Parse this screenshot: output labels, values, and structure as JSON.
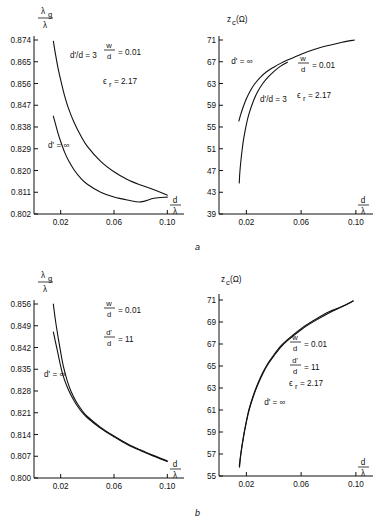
{
  "figure": {
    "caption_a": "a",
    "caption_b": "b"
  },
  "chart_data": [
    {
      "id": "panel-a-left",
      "type": "line",
      "title": "",
      "ylabel": "λ_g/λ",
      "xlabel": "d/λ",
      "ylabel_num": "λ",
      "ylabel_num_sub": "g",
      "ylabel_den": "λ",
      "xlabel_num": "d",
      "xlabel_den": "λ",
      "xlim": [
        0.0,
        0.11
      ],
      "ylim": [
        0.802,
        0.874
      ],
      "xticks": [
        0.02,
        0.06,
        0.1
      ],
      "xtick_labels": [
        "0.02",
        "0.06",
        "0.10"
      ],
      "yticks": [
        0.802,
        0.811,
        0.82,
        0.829,
        0.838,
        0.847,
        0.856,
        0.865,
        0.874
      ],
      "ytick_labels": [
        "0.802",
        "0.811",
        "0.820",
        "0.829",
        "0.838",
        "0.847",
        "0.856",
        "0.865",
        "0.874"
      ],
      "grid": false,
      "annotations": [
        {
          "text": "d'/d = 3",
          "x": 0.027,
          "y": 0.8665
        },
        {
          "text": "d' = ∞",
          "x": 0.0105,
          "y": 0.8295
        }
      ],
      "param_w_over_d": "0.01",
      "param_eps_r": "2.17",
      "param_labels": {
        "w_num": "w",
        "w_den": "d",
        "w_val": "= 0.01",
        "eps": "ϵ",
        "eps_sub": "r",
        "eps_val": "= 2.17"
      },
      "series": [
        {
          "name": "d'/d = 3",
          "points": [
            [
              0.0145,
              0.8735
            ],
            [
              0.016,
              0.8685
            ],
            [
              0.018,
              0.8625
            ],
            [
              0.02,
              0.8575
            ],
            [
              0.023,
              0.8508
            ],
            [
              0.026,
              0.8455
            ],
            [
              0.03,
              0.84
            ],
            [
              0.035,
              0.8345
            ],
            [
              0.04,
              0.83
            ],
            [
              0.05,
              0.8238
            ],
            [
              0.06,
              0.8195
            ],
            [
              0.07,
              0.8163
            ],
            [
              0.08,
              0.814
            ],
            [
              0.09,
              0.812
            ],
            [
              0.1,
              0.8098
            ]
          ]
        },
        {
          "name": "d' = ∞",
          "points": [
            [
              0.0145,
              0.8425
            ],
            [
              0.016,
              0.8395
            ],
            [
              0.018,
              0.8355
            ],
            [
              0.02,
              0.832
            ],
            [
              0.023,
              0.8275
            ],
            [
              0.026,
              0.824
            ],
            [
              0.03,
              0.8203
            ],
            [
              0.035,
              0.8168
            ],
            [
              0.04,
              0.8143
            ],
            [
              0.05,
              0.811
            ],
            [
              0.06,
              0.809
            ],
            [
              0.07,
              0.8078
            ],
            [
              0.08,
              0.807
            ],
            [
              0.09,
              0.8085
            ],
            [
              0.1,
              0.809
            ]
          ]
        }
      ]
    },
    {
      "id": "panel-a-right",
      "type": "line",
      "title": "",
      "ylabel": "z_c (Ω)",
      "xlabel": "d/λ",
      "ylabel_main": "z",
      "ylabel_sub": "c",
      "ylabel_unit": "(Ω)",
      "xlabel_num": "d",
      "xlabel_den": "λ",
      "xlim": [
        0.0,
        0.11
      ],
      "ylim": [
        39,
        71
      ],
      "xticks": [
        0.02,
        0.06,
        0.1
      ],
      "xtick_labels": [
        "0.02",
        "0.06",
        "0.10"
      ],
      "yticks": [
        39,
        43,
        47,
        51,
        55,
        59,
        63,
        67,
        71
      ],
      "ytick_labels": [
        "39",
        "43",
        "47",
        "51",
        "55",
        "59",
        "63",
        "67",
        "71"
      ],
      "grid": false,
      "annotations": [
        {
          "text": "d' = ∞",
          "x": 0.009,
          "y": 66.6
        },
        {
          "text": "d'/d = 3",
          "x": 0.03,
          "y": 59.6
        }
      ],
      "param_w_over_d": "0.01",
      "param_eps_r": "2.17",
      "param_labels": {
        "w_num": "w",
        "w_den": "d",
        "w_val": "= 0.01",
        "eps": "ϵ",
        "eps_sub": "r",
        "eps_val": "= 2.17"
      },
      "series": [
        {
          "name": "d' = ∞",
          "points": [
            [
              0.0145,
              56.1
            ],
            [
              0.016,
              57.4
            ],
            [
              0.018,
              58.9
            ],
            [
              0.02,
              60.2
            ],
            [
              0.023,
              61.7
            ],
            [
              0.026,
              62.9
            ],
            [
              0.03,
              64.1
            ],
            [
              0.035,
              65.2
            ],
            [
              0.04,
              66.0
            ],
            [
              0.045,
              66.7
            ],
            [
              0.05,
              67.3
            ],
            [
              0.06,
              68.4
            ],
            [
              0.07,
              69.3
            ],
            [
              0.08,
              70.0
            ],
            [
              0.09,
              70.6
            ],
            [
              0.099,
              71.0
            ]
          ]
        },
        {
          "name": "d'/d = 3",
          "points": [
            [
              0.0148,
              44.7
            ],
            [
              0.0152,
              46.6
            ],
            [
              0.016,
              48.8
            ],
            [
              0.017,
              51.0
            ],
            [
              0.018,
              52.8
            ],
            [
              0.02,
              55.5
            ],
            [
              0.022,
              57.5
            ],
            [
              0.025,
              59.7
            ],
            [
              0.028,
              61.4
            ],
            [
              0.032,
              63.0
            ],
            [
              0.036,
              64.2
            ],
            [
              0.04,
              65.2
            ],
            [
              0.045,
              66.2
            ],
            [
              0.05,
              66.9
            ]
          ]
        }
      ]
    },
    {
      "id": "panel-b-left",
      "type": "line",
      "title": "",
      "ylabel": "λ_g/λ",
      "xlabel": "d/λ",
      "ylabel_num": "λ",
      "ylabel_num_sub": "g",
      "ylabel_den": "λ",
      "xlabel_num": "d",
      "xlabel_den": "λ",
      "xlim": [
        0.0,
        0.11
      ],
      "ylim": [
        0.8,
        0.856
      ],
      "xticks": [
        0.02,
        0.06,
        0.1
      ],
      "xtick_labels": [
        "0.02",
        "0.06",
        "0.10"
      ],
      "yticks": [
        0.8,
        0.807,
        0.814,
        0.821,
        0.828,
        0.835,
        0.842,
        0.849,
        0.856
      ],
      "ytick_labels": [
        "0.800",
        "0.807",
        "0.814",
        "0.821",
        "0.828",
        "0.835",
        "0.842",
        "0.849",
        "0.856"
      ],
      "grid": false,
      "annotations": [
        {
          "text": "d' = ∞",
          "x": 0.0075,
          "y": 0.8325
        }
      ],
      "param_labels": {
        "w_num": "w",
        "w_den": "d",
        "w_val": "= 0.01",
        "dp_num": "d'",
        "dp_den": "d",
        "dp_val": "= 11"
      },
      "series": [
        {
          "name": "d'/d = 11",
          "points": [
            [
              0.0145,
              0.856
            ],
            [
              0.016,
              0.851
            ],
            [
              0.018,
              0.8455
            ],
            [
              0.02,
              0.8405
            ],
            [
              0.022,
              0.836
            ],
            [
              0.025,
              0.8312
            ],
            [
              0.028,
              0.8277
            ],
            [
              0.032,
              0.8243
            ],
            [
              0.036,
              0.8218
            ],
            [
              0.04,
              0.8198
            ],
            [
              0.05,
              0.8163
            ],
            [
              0.06,
              0.8135
            ],
            [
              0.07,
              0.811
            ],
            [
              0.08,
              0.809
            ],
            [
              0.09,
              0.8072
            ],
            [
              0.1,
              0.8055
            ]
          ]
        },
        {
          "name": "d' = ∞",
          "points": [
            [
              0.0145,
              0.847
            ],
            [
              0.016,
              0.844
            ],
            [
              0.018,
              0.84
            ],
            [
              0.02,
              0.836
            ],
            [
              0.022,
              0.8327
            ],
            [
              0.025,
              0.8292
            ],
            [
              0.028,
              0.8265
            ],
            [
              0.032,
              0.8235
            ],
            [
              0.036,
              0.8212
            ],
            [
              0.04,
              0.8194
            ],
            [
              0.05,
              0.816
            ],
            [
              0.06,
              0.8133
            ],
            [
              0.07,
              0.8108
            ],
            [
              0.08,
              0.8088
            ],
            [
              0.09,
              0.807
            ],
            [
              0.1,
              0.8053
            ]
          ]
        }
      ]
    },
    {
      "id": "panel-b-right",
      "type": "line",
      "title": "",
      "ylabel": "z_c (Ω)",
      "xlabel": "d/λ",
      "ylabel_main": "z",
      "ylabel_sub": "c",
      "ylabel_unit": "(Ω)",
      "xlabel_num": "d",
      "xlabel_den": "λ",
      "xlim": [
        0.0,
        0.11
      ],
      "ylim": [
        55,
        71
      ],
      "xticks": [
        0.02,
        0.06,
        0.1
      ],
      "xtick_labels": [
        "0.02",
        "0.06",
        "0.10"
      ],
      "yticks": [
        55,
        57,
        59,
        61,
        63,
        65,
        67,
        69,
        71
      ],
      "ytick_labels": [
        "55",
        "57",
        "59",
        "61",
        "63",
        "65",
        "67",
        "69",
        "71"
      ],
      "grid": false,
      "annotations": [
        {
          "text": "d' = ∞",
          "x": 0.033,
          "y": 61.5
        }
      ],
      "param_labels": {
        "w_num": "w",
        "w_den": "d",
        "w_val": "= 0.01",
        "dp_num": "d'",
        "dp_den": "d",
        "dp_val": "= 11",
        "eps": "ϵ",
        "eps_sub": "r",
        "eps_val": "= 2.17"
      },
      "series": [
        {
          "name": "d'/d = 11",
          "points": [
            [
              0.0148,
              55.9
            ],
            [
              0.016,
              57.1
            ],
            [
              0.018,
              58.7
            ],
            [
              0.02,
              60.0
            ],
            [
              0.022,
              61.1
            ],
            [
              0.025,
              62.3
            ],
            [
              0.028,
              63.3
            ],
            [
              0.032,
              64.4
            ],
            [
              0.036,
              65.3
            ],
            [
              0.04,
              66.0
            ],
            [
              0.045,
              66.8
            ],
            [
              0.05,
              67.4
            ],
            [
              0.06,
              68.4
            ],
            [
              0.07,
              69.2
            ],
            [
              0.08,
              69.9
            ],
            [
              0.09,
              70.4
            ],
            [
              0.098,
              70.9
            ]
          ]
        },
        {
          "name": "d' = ∞",
          "points": [
            [
              0.015,
              55.8
            ],
            [
              0.016,
              57.0
            ],
            [
              0.018,
              58.6
            ],
            [
              0.02,
              59.9
            ],
            [
              0.022,
              61.0
            ],
            [
              0.025,
              62.2
            ],
            [
              0.028,
              63.2
            ],
            [
              0.032,
              64.3
            ],
            [
              0.036,
              65.2
            ],
            [
              0.04,
              65.9
            ],
            [
              0.045,
              66.7
            ],
            [
              0.05,
              67.3
            ],
            [
              0.06,
              68.3
            ],
            [
              0.07,
              69.1
            ],
            [
              0.08,
              69.8
            ],
            [
              0.09,
              70.4
            ],
            [
              0.098,
              70.9
            ]
          ]
        }
      ]
    }
  ]
}
